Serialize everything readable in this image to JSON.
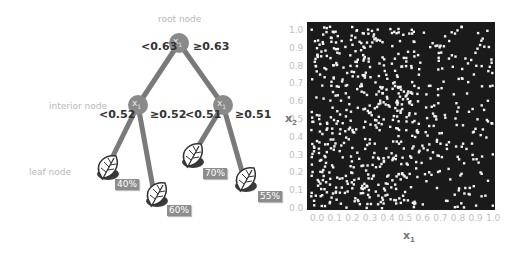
{
  "tree": {
    "captions": {
      "root": "root node",
      "interior": "interior node",
      "leaf": "leaf node"
    },
    "nodes": [
      {
        "id": "root",
        "variable": "x",
        "subscript": "1",
        "left_split": "<0.63",
        "right_split": "≥0.63"
      },
      {
        "id": "left",
        "variable": "x",
        "subscript": "1",
        "left_split": "<0.52",
        "right_split": "≥0.52"
      },
      {
        "id": "right",
        "variable": "x",
        "subscript": "1",
        "left_split": "<0.51",
        "right_split": "≥0.51"
      }
    ],
    "leaves": [
      {
        "id": "leaf-1",
        "icon": "leaf-icon",
        "value": "40%"
      },
      {
        "id": "leaf-2",
        "icon": "leaf-icon",
        "value": "60%"
      },
      {
        "id": "leaf-3",
        "icon": "leaf-icon",
        "value": "70%"
      },
      {
        "id": "leaf-4",
        "icon": "leaf-icon",
        "value": "55%"
      }
    ],
    "colors": {
      "branch": "#7a7a7a",
      "node": "#8a8a8a",
      "leaf_dark": "#3a3a3a",
      "label_bg": "#8d8d8d"
    }
  },
  "scatter": {
    "xlabel": "x",
    "xlabel_sub": "1",
    "ylabel": "x",
    "ylabel_sub": "2",
    "xticks": [
      "0.0",
      "0.1",
      "0.2",
      "0.3",
      "0.4",
      "0.5",
      "0.6",
      "0.7",
      "0.8",
      "0.9",
      "1.0"
    ],
    "yticks": [
      "1.0",
      "0.9",
      "0.8",
      "0.7",
      "0.6",
      "0.5",
      "0.4",
      "0.3",
      "0.2",
      "0.1",
      "0.0"
    ],
    "colors": {
      "background": "#1a1a1a",
      "points": "#f2f2f2"
    }
  },
  "chart_data": {
    "type": "scatter",
    "title": "",
    "xlabel": "x1",
    "ylabel": "x2",
    "xlim": [
      0,
      1
    ],
    "ylim": [
      0,
      1
    ],
    "grid": false,
    "point_count_estimate": 700
  }
}
